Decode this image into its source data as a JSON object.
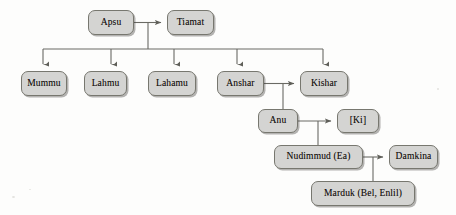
{
  "diagram": {
    "canvas": {
      "width": 456,
      "height": 215
    },
    "style": {
      "node_fill": "#d4d4d2",
      "node_border": "#77776f",
      "edge_color": "#6a6a64",
      "background": "#fdfdfc",
      "text_color": "#15110e"
    },
    "nodes": [
      {
        "id": "apsu",
        "label": "Apsu",
        "x": 88,
        "y": 10,
        "w": 46,
        "h": 25
      },
      {
        "id": "tiamat",
        "label": "Tiamat",
        "x": 167,
        "y": 10,
        "w": 47,
        "h": 25
      },
      {
        "id": "mummu",
        "label": "Mummu",
        "x": 21,
        "y": 71,
        "w": 46,
        "h": 25
      },
      {
        "id": "lahmu",
        "label": "Lahmu",
        "x": 84,
        "y": 71,
        "w": 43,
        "h": 25
      },
      {
        "id": "lahamu",
        "label": "Lahamu",
        "x": 148,
        "y": 71,
        "w": 48,
        "h": 25
      },
      {
        "id": "anshar",
        "label": "Anshar",
        "x": 217,
        "y": 71,
        "w": 47,
        "h": 25
      },
      {
        "id": "kishar",
        "label": "Kishar",
        "x": 300,
        "y": 71,
        "w": 48,
        "h": 25
      },
      {
        "id": "anu",
        "label": "Anu",
        "x": 258,
        "y": 109,
        "w": 40,
        "h": 24
      },
      {
        "id": "ki",
        "label": "[Ki]",
        "x": 337,
        "y": 109,
        "w": 42,
        "h": 24
      },
      {
        "id": "nudimmud",
        "label": "Nudimmud (Ea)",
        "x": 274,
        "y": 145,
        "w": 89,
        "h": 24
      },
      {
        "id": "damkina",
        "label": "Damkina",
        "x": 389,
        "y": 145,
        "w": 49,
        "h": 24
      },
      {
        "id": "marduk",
        "label": "Marduk (Bel, Enlil)",
        "x": 311,
        "y": 181,
        "w": 104,
        "h": 25
      }
    ],
    "edges": [
      {
        "id": "apsu-tiamat",
        "from": "apsu",
        "to": "tiamat",
        "type": "arrow-right"
      },
      {
        "id": "pair-stem-top",
        "from": "apsu-tiamat-midpoint",
        "to": "sibling-bar",
        "type": "stem"
      },
      {
        "id": "sibling-bar",
        "from": "sibling-bar",
        "to": "children-row",
        "type": "bus",
        "children": [
          "mummu",
          "lahmu",
          "lahamu",
          "anshar",
          "kishar"
        ]
      },
      {
        "id": "anshar-kishar",
        "from": "anshar",
        "to": "kishar",
        "type": "arrow-right"
      },
      {
        "id": "anshar-kishar-anu",
        "from": "anshar-kishar-midpoint",
        "to": "anu",
        "type": "stem"
      },
      {
        "id": "anu-ki",
        "from": "anu",
        "to": "ki",
        "type": "arrow-right"
      },
      {
        "id": "anu-ki-nudimmud",
        "from": "anu-ki-midpoint",
        "to": "nudimmud",
        "type": "stem"
      },
      {
        "id": "nudimmud-damkina",
        "from": "nudimmud",
        "to": "damkina",
        "type": "arrow-right"
      },
      {
        "id": "nudimmud-damkina-marduk",
        "from": "nudimmud-damkina-midpoint",
        "to": "marduk",
        "type": "stem"
      }
    ]
  }
}
